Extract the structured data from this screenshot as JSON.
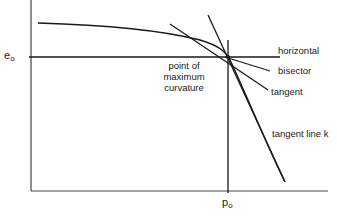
{
  "diagram": {
    "title": "",
    "axes": {
      "y_label_base": "e",
      "y_label_sub": "o",
      "x_label_base": "p",
      "x_label_sub": "o"
    },
    "labels": {
      "point_line1": "point of",
      "point_line2": "maximum",
      "point_line3": "curvature",
      "horizontal": "horizontal",
      "bisector": "bisector",
      "tangent": "tangent",
      "tangent_line_k": "tangent line k"
    },
    "colors": {
      "line": "#1a1a1a",
      "axis": "#333333",
      "background": "#ffffff"
    }
  }
}
